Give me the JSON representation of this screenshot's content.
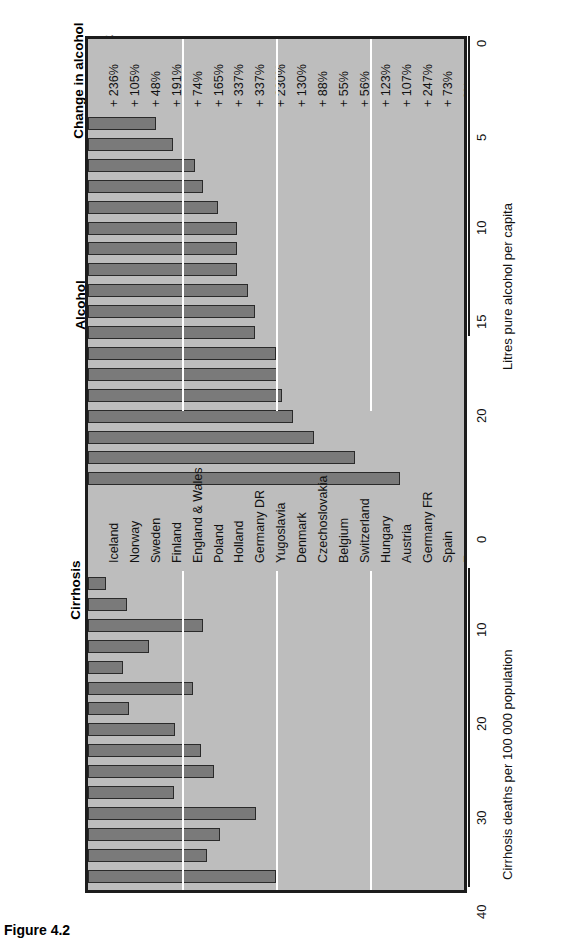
{
  "figure": {
    "caption": "Figure 4.2"
  },
  "sections": {
    "change_title": "Change in alcohol\nconsumption\nsince 1950–52",
    "alcohol_title": "Alcohol\nconsumption",
    "cirrhosis_title": "Cirrhosis\nof liver"
  },
  "axes": {
    "alcohol_caption": "Litres pure alcohol per capita",
    "alcohol_ticks": [
      "0",
      "5",
      "10",
      "15",
      "20"
    ],
    "cirrhosis_caption": "Cirrhosis deaths per 100 000 population",
    "cirrhosis_ticks": [
      "0",
      "10",
      "20",
      "30",
      "40"
    ]
  },
  "chart_data": {
    "type": "bar",
    "orientation": "horizontal-rotated",
    "categories": [
      "Iceland",
      "Norway",
      "Sweden",
      "Finland",
      "England & Wales",
      "Poland",
      "Holland",
      "Germany DR",
      "Yugoslavia",
      "Denmark",
      "Czechoslovakia",
      "Belgium",
      "Switzerland",
      "Hungary",
      "Austria",
      "Germany FR",
      "Spain",
      "France"
    ],
    "series": [
      {
        "name": "Alcohol consumption",
        "unit": "Litres pure alcohol per capita",
        "xlabel": "Litres pure alcohol per capita",
        "xlim": [
          0,
          20
        ],
        "ticks": [
          0,
          5,
          10,
          15,
          20
        ],
        "values": [
          3.6,
          4.5,
          5.7,
          6.1,
          6.9,
          7.9,
          7.9,
          7.9,
          8.5,
          8.9,
          8.9,
          10.0,
          10.1,
          10.3,
          10.9,
          12.0,
          14.2,
          16.6
        ]
      },
      {
        "name": "Cirrhosis of liver",
        "unit": "Cirrhosis deaths per 100 000 population",
        "xlabel": "Cirrhosis deaths per 100 000 population",
        "xlim": [
          0,
          40
        ],
        "ticks": [
          0,
          10,
          20,
          30,
          40
        ],
        "values": [
          1.9,
          4.2,
          12.2,
          6.5,
          3.7,
          11.2,
          4.4,
          9.3,
          12.0,
          13.4,
          9.1,
          17.9,
          14.0,
          12.7,
          20.0,
          33.2,
          28.2,
          23.0
        ]
      },
      {
        "name": "Change in alcohol consumption since 1950–52",
        "unit": "percent",
        "labels": [
          "+ 236%",
          "+ 105%",
          "+ 48%",
          "+ 191%",
          "+ 74%",
          "+ 165%",
          "+ 337%",
          "+ 337%",
          "+ 230%",
          "+ 130%",
          "+ 88%",
          "+ 55%",
          "+ 56%",
          "+ 123%",
          "+ 107%",
          "+ 247%",
          "+ 73%",
          "- 6%"
        ],
        "values": [
          236,
          105,
          48,
          191,
          74,
          165,
          337,
          337,
          230,
          130,
          88,
          55,
          56,
          123,
          107,
          247,
          73,
          -6
        ]
      }
    ],
    "grid": true,
    "legend": "none",
    "colors": {
      "panel_background": "#bdbdbd",
      "bar_fill": "#7a7a7a",
      "bar_stroke": "#2a2a2a",
      "gridline": "#ffffff",
      "frame": "#1c1c1c",
      "text": "#111111"
    }
  }
}
